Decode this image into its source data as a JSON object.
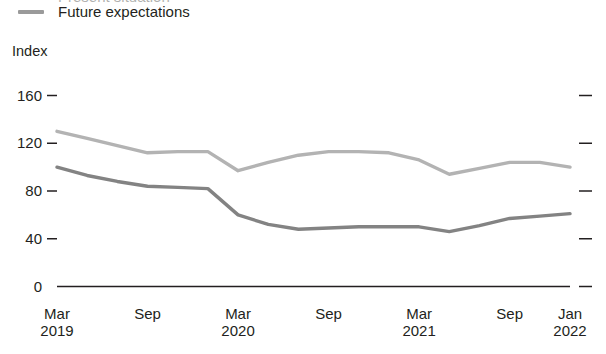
{
  "legend": {
    "entries": [
      {
        "label": "Present situation",
        "color": "#b3b3b3",
        "clipped": true
      },
      {
        "label": "Future expectations",
        "color": "#9a9a9a",
        "clipped": false
      }
    ]
  },
  "axis": {
    "y_title": "Index",
    "y_ticks": [
      "0",
      "40",
      "80",
      "120",
      "160"
    ],
    "x_ticks": [
      {
        "month": "Mar",
        "year": "2019"
      },
      {
        "month": "Sep",
        "year": ""
      },
      {
        "month": "Mar",
        "year": "2020"
      },
      {
        "month": "Sep",
        "year": ""
      },
      {
        "month": "Mar",
        "year": "2021"
      },
      {
        "month": "Sep",
        "year": ""
      },
      {
        "month": "Jan",
        "year": "2022"
      }
    ]
  },
  "colors": {
    "series_upper": "#b3b3b3",
    "series_lower": "#838383",
    "axis": "#231f20",
    "text": "#231f20",
    "background": "#ffffff"
  },
  "chart_data": {
    "type": "line",
    "title": "",
    "subtitle": "",
    "xlabel": "",
    "ylabel": "Index",
    "ylim": [
      0,
      160
    ],
    "grid": false,
    "legend_position": "top-left",
    "x": [
      "Mar 2019",
      "May 2019",
      "Jul 2019",
      "Sep 2019",
      "Nov 2019",
      "Jan 2020",
      "Mar 2020",
      "May 2020",
      "Jul 2020",
      "Sep 2020",
      "Nov 2020",
      "Jan 2021",
      "Mar 2021",
      "May 2021",
      "Jul 2021",
      "Sep 2021",
      "Nov 2021",
      "Jan 2022"
    ],
    "series": [
      {
        "name": "Present situation",
        "color": "#b3b3b3",
        "values": [
          130,
          124,
          118,
          112,
          113,
          113,
          97,
          104,
          110,
          113,
          113,
          112,
          106,
          94,
          99,
          104,
          104,
          100
        ]
      },
      {
        "name": "Future expectations",
        "color": "#838383",
        "values": [
          100,
          93,
          88,
          84,
          83,
          82,
          60,
          52,
          48,
          49,
          50,
          50,
          50,
          46,
          51,
          57,
          59,
          61
        ]
      }
    ]
  }
}
